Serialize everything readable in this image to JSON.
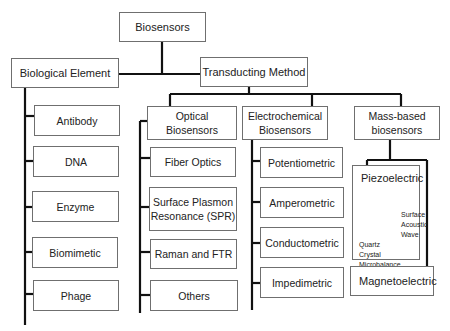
{
  "diagram": {
    "root": {
      "label": "Biosensors"
    },
    "biological_element": {
      "label": "Biological Element",
      "children": [
        "Antibody",
        "DNA",
        "Enzyme",
        "Biomimetic",
        "Phage"
      ]
    },
    "transducing_method": {
      "label": "Transducting Method",
      "categories": {
        "optical": {
          "label": "Optical\nBiosensors",
          "children": [
            "Fiber Optics",
            "Surface Plasmon\nResonance (SPR)",
            "Raman and FTR",
            "Others"
          ]
        },
        "electrochemical": {
          "label": "Electrochemical\nBiosensors",
          "children": [
            "Potentiometric",
            "Amperometric",
            "Conductometric",
            "Impedimetric"
          ]
        },
        "mass_based": {
          "label": "Mass-based\nbiosensors",
          "piezoelectric": {
            "label": "Piezoelectric",
            "subtypes": [
              "Surface\nAcoustic\nWave",
              "Quartz\nCrystal\nMicrobalance"
            ]
          },
          "magnetoelectric": {
            "label": "Magnetoelectric"
          }
        }
      }
    },
    "colors": {
      "line": "#111111",
      "border": "#6f6f6f",
      "arrow": "#888888",
      "background": "#ffffff"
    }
  }
}
